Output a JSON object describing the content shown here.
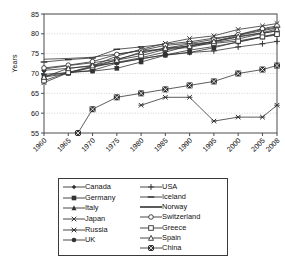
{
  "chart_data": {
    "type": "line",
    "title": "",
    "xlabel": "",
    "ylabel": "Years",
    "xlim": [
      1960,
      2008
    ],
    "ylim": [
      55,
      85
    ],
    "yticks": [
      55,
      60,
      65,
      70,
      75,
      80,
      85
    ],
    "xticks": [
      1960,
      1965,
      1970,
      1975,
      1980,
      1985,
      1990,
      1995,
      2000,
      2005,
      2008
    ],
    "grid": true,
    "legend_position": "below-plot",
    "series": [
      {
        "name": "Canada",
        "marker": "filled-diamond",
        "x": [
          1960,
          1965,
          1970,
          1975,
          1980,
          1985,
          1990,
          1995,
          2000,
          2005,
          2008
        ],
        "values": [
          71.1,
          72.0,
          72.7,
          73.6,
          75.1,
          76.4,
          77.4,
          78.0,
          79.2,
          80.2,
          80.7
        ]
      },
      {
        "name": "Germany",
        "marker": "filled-square",
        "x": [
          1960,
          1965,
          1970,
          1975,
          1980,
          1985,
          1990,
          1995,
          2000,
          2005,
          2008
        ],
        "values": [
          69.3,
          70.3,
          70.6,
          71.3,
          72.9,
          74.6,
          75.3,
          76.5,
          78.0,
          79.2,
          80.1
        ]
      },
      {
        "name": "Italy",
        "marker": "filled-triangle",
        "x": [
          1960,
          1965,
          1970,
          1975,
          1980,
          1985,
          1990,
          1995,
          2000,
          2005,
          2008
        ],
        "values": [
          69.1,
          70.0,
          71.6,
          72.8,
          74.0,
          75.4,
          77.0,
          78.1,
          79.6,
          80.8,
          81.5
        ]
      },
      {
        "name": "Japan",
        "marker": "cross-x",
        "x": [
          1960,
          1965,
          1970,
          1975,
          1980,
          1985,
          1990,
          1995,
          2000,
          2005,
          2008
        ],
        "values": [
          67.7,
          70.2,
          71.9,
          74.4,
          76.1,
          77.6,
          78.8,
          79.5,
          81.1,
          82.0,
          82.6
        ]
      },
      {
        "name": "Russia",
        "marker": "star-burst",
        "x": [
          1980,
          1985,
          1990,
          1995,
          2000,
          2005,
          2008
        ],
        "values": [
          62.0,
          64.0,
          64.0,
          58.0,
          59.0,
          59.0,
          62.0
        ]
      },
      {
        "name": "UK",
        "marker": "filled-circle",
        "x": [
          1960,
          1965,
          1970,
          1975,
          1980,
          1985,
          1990,
          1995,
          2000,
          2005,
          2008
        ],
        "values": [
          70.8,
          71.3,
          71.9,
          72.7,
          73.7,
          74.7,
          75.9,
          76.8,
          77.9,
          79.2,
          79.7
        ]
      },
      {
        "name": "USA",
        "marker": "plus",
        "x": [
          1960,
          1965,
          1970,
          1975,
          1980,
          1985,
          1990,
          1995,
          2000,
          2005,
          2008
        ],
        "values": [
          69.8,
          70.2,
          70.8,
          72.6,
          73.7,
          74.7,
          75.3,
          75.7,
          76.7,
          77.5,
          78.1
        ]
      },
      {
        "name": "Iceland",
        "marker": "short-dash",
        "x": [
          1960,
          1965,
          1970,
          1975,
          1980,
          1985,
          1990,
          1995,
          2000,
          2005,
          2008
        ],
        "values": [
          72.9,
          73.5,
          73.9,
          76.1,
          76.7,
          77.4,
          78.0,
          78.9,
          79.7,
          81.1,
          81.7
        ]
      },
      {
        "name": "Norway",
        "marker": "line-only",
        "x": [
          1960,
          1965,
          1970,
          1975,
          1980,
          1985,
          1990,
          1995,
          2000,
          2005,
          2008
        ],
        "values": [
          73.6,
          73.8,
          74.1,
          74.9,
          75.8,
          76.0,
          76.6,
          77.8,
          78.7,
          80.1,
          80.8
        ]
      },
      {
        "name": "Switzerland",
        "marker": "open-circle",
        "x": [
          1960,
          1965,
          1970,
          1975,
          1980,
          1985,
          1990,
          1995,
          2000,
          2005,
          2008
        ],
        "values": [
          71.4,
          72.1,
          73.0,
          74.8,
          75.8,
          77.1,
          77.6,
          78.6,
          79.8,
          81.3,
          82.0
        ]
      },
      {
        "name": "Greece",
        "marker": "open-square",
        "x": [
          1960,
          1965,
          1970,
          1975,
          1980,
          1985,
          1990,
          1995,
          2000,
          2005,
          2008
        ],
        "values": [
          68.2,
          70.3,
          71.6,
          73.4,
          74.5,
          76.1,
          77.0,
          77.6,
          78.2,
          79.3,
          79.9
        ]
      },
      {
        "name": "Spain",
        "marker": "open-triangle",
        "x": [
          1960,
          1965,
          1970,
          1975,
          1980,
          1985,
          1990,
          1995,
          2000,
          2005,
          2008
        ],
        "values": [
          69.1,
          71.3,
          72.0,
          73.4,
          75.4,
          76.4,
          76.9,
          78.1,
          79.3,
          80.3,
          81.2
        ]
      },
      {
        "name": "China",
        "marker": "filled-square-x",
        "x": [
          1967,
          1970,
          1975,
          1980,
          1985,
          1990,
          1995,
          2000,
          2005,
          2008
        ],
        "values": [
          55.0,
          61.0,
          64.0,
          65.0,
          66.0,
          67.0,
          68.0,
          70.0,
          71.0,
          72.0
        ]
      }
    ]
  },
  "legend": {
    "left_items": [
      {
        "label": "Canada",
        "marker": "filled-diamond"
      },
      {
        "label": "Germany",
        "marker": "filled-square"
      },
      {
        "label": "Italy",
        "marker": "filled-triangle"
      },
      {
        "label": "Japan",
        "marker": "cross-x"
      },
      {
        "label": "Russia",
        "marker": "star-burst"
      },
      {
        "label": "UK",
        "marker": "filled-circle"
      }
    ],
    "right_items": [
      {
        "label": "USA",
        "marker": "plus"
      },
      {
        "label": "Iceland",
        "marker": "short-dash"
      },
      {
        "label": "Norway",
        "marker": "line-only"
      },
      {
        "label": "Switzerland",
        "marker": "open-circle"
      },
      {
        "label": "Greece",
        "marker": "open-square"
      },
      {
        "label": "Spain",
        "marker": "open-triangle"
      },
      {
        "label": "China",
        "marker": "filled-square-x"
      }
    ]
  },
  "colors": {
    "line": "#333333",
    "axis": "#4d4d4d",
    "grid": "#bfbfbf",
    "background": "#ffffff",
    "text": "#111111"
  }
}
